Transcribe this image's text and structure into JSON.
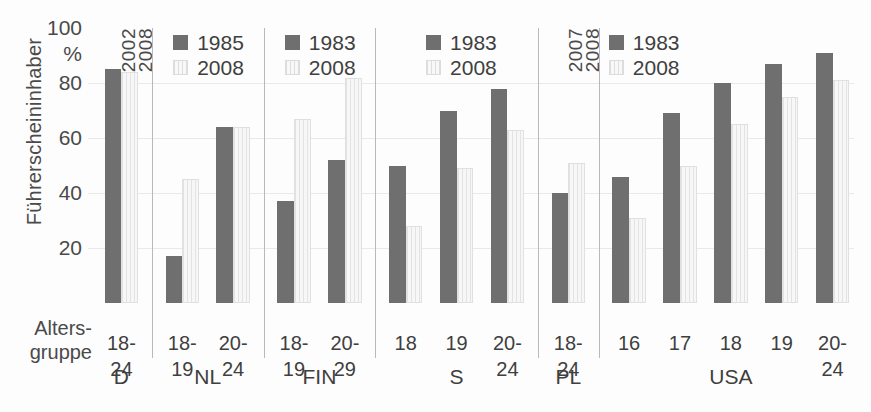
{
  "axis": {
    "y_title": "Führerscheininhaber",
    "unit": "%",
    "ticks": [
      100,
      80,
      60,
      40,
      20
    ],
    "x_title_line1": "Alters-",
    "x_title_line2": "gruppe"
  },
  "colors": {
    "series_old": "#6f6f6f",
    "series_new": "#f2f2f2",
    "separator": "#b9b9b9",
    "text": "#3f3f3f"
  },
  "legends": [
    {
      "group": "NL",
      "old": "1985",
      "new": "2008"
    },
    {
      "group": "FIN",
      "old": "1983",
      "new": "2008"
    },
    {
      "group": "S",
      "old": "1983",
      "new": "2008"
    },
    {
      "group": "USA",
      "old": "1983",
      "new": "2008"
    }
  ],
  "inline_year_labels": [
    {
      "group": "D",
      "old": "2002",
      "new": "2008"
    },
    {
      "group": "PL",
      "old": "2007",
      "new": "2008"
    }
  ],
  "chart_data": {
    "type": "bar",
    "title": "",
    "xlabel": "Altersgruppe",
    "ylabel": "Führerscheininhaber",
    "unit": "%",
    "ylim": [
      0,
      100
    ],
    "yticks": [
      20,
      40,
      60,
      80,
      100
    ],
    "grid": true,
    "legend_position": "inside-top",
    "categories": [
      "D 18-24",
      "NL 18-19",
      "NL 20-24",
      "FIN 18-19",
      "FIN 20-29",
      "S 18",
      "S 19",
      "S 20-24",
      "PL 18-24",
      "USA 16",
      "USA 17",
      "USA 18",
      "USA 19",
      "USA 20-24"
    ],
    "series": [
      {
        "name": "earlier year",
        "values": [
          85,
          17,
          64,
          37,
          52,
          50,
          70,
          78,
          40,
          46,
          69,
          80,
          87,
          91
        ]
      },
      {
        "name": "2008",
        "values": [
          84,
          45,
          64,
          67,
          82,
          28,
          49,
          63,
          51,
          31,
          50,
          65,
          75,
          81
        ]
      }
    ],
    "groups": [
      {
        "country": "D",
        "year_old": "2002",
        "year_new": "2008",
        "bars": [
          {
            "age": "18-24",
            "old": 85,
            "new": 84
          }
        ]
      },
      {
        "country": "NL",
        "year_old": "1985",
        "year_new": "2008",
        "bars": [
          {
            "age": "18-19",
            "old": 17,
            "new": 45
          },
          {
            "age": "20-24",
            "old": 64,
            "new": 64
          }
        ]
      },
      {
        "country": "FIN",
        "year_old": "1983",
        "year_new": "2008",
        "bars": [
          {
            "age": "18-19",
            "old": 37,
            "new": 67
          },
          {
            "age": "20-29",
            "old": 52,
            "new": 82
          }
        ]
      },
      {
        "country": "S",
        "year_old": "1983",
        "year_new": "2008",
        "bars": [
          {
            "age": "18",
            "old": 50,
            "new": 28
          },
          {
            "age": "19",
            "old": 70,
            "new": 49
          },
          {
            "age": "20-24",
            "old": 78,
            "new": 63
          }
        ]
      },
      {
        "country": "PL",
        "year_old": "2007",
        "year_new": "2008",
        "bars": [
          {
            "age": "18-24",
            "old": 40,
            "new": 51
          }
        ]
      },
      {
        "country": "USA",
        "year_old": "1983",
        "year_new": "2008",
        "bars": [
          {
            "age": "16",
            "old": 46,
            "new": 31
          },
          {
            "age": "17",
            "old": 69,
            "new": 50
          },
          {
            "age": "18",
            "old": 80,
            "new": 65
          },
          {
            "age": "19",
            "old": 87,
            "new": 75
          },
          {
            "age": "20-24",
            "old": 91,
            "new": 81
          }
        ]
      }
    ]
  }
}
